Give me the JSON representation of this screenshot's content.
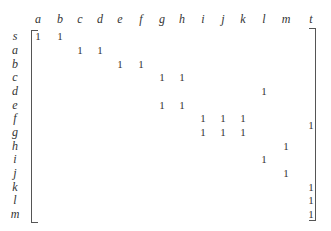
{
  "matrix": {
    "columns": [
      "a",
      "b",
      "c",
      "d",
      "e",
      "f",
      "g",
      "h",
      "i",
      "j",
      "k",
      "l",
      "m",
      "t"
    ],
    "rows": [
      "s",
      "a",
      "b",
      "c",
      "d",
      "e",
      "f",
      "g",
      "h",
      "i",
      "j",
      "k",
      "l",
      "m"
    ],
    "entries": [
      {
        "row": "s",
        "col": "a",
        "value": "1"
      },
      {
        "row": "s",
        "col": "b",
        "value": "1"
      },
      {
        "row": "a",
        "col": "c",
        "value": "1"
      },
      {
        "row": "a",
        "col": "d",
        "value": "1"
      },
      {
        "row": "b",
        "col": "e",
        "value": "1"
      },
      {
        "row": "b",
        "col": "f",
        "value": "1"
      },
      {
        "row": "c",
        "col": "g",
        "value": "1"
      },
      {
        "row": "c",
        "col": "h",
        "value": "1"
      },
      {
        "row": "d",
        "col": "l",
        "value": "1"
      },
      {
        "row": "e",
        "col": "g",
        "value": "1"
      },
      {
        "row": "e",
        "col": "h",
        "value": "1"
      },
      {
        "row": "f",
        "col": "i",
        "value": "1"
      },
      {
        "row": "f",
        "col": "j",
        "value": "1"
      },
      {
        "row": "f",
        "col": "k",
        "value": "1"
      },
      {
        "row": "g",
        "col": "i",
        "value": "1"
      },
      {
        "row": "g",
        "col": "j",
        "value": "1"
      },
      {
        "row": "g",
        "col": "k",
        "value": "1"
      },
      {
        "row": "g",
        "col": "t",
        "value": "1"
      },
      {
        "row": "h",
        "col": "m",
        "value": "1"
      },
      {
        "row": "i",
        "col": "l",
        "value": "1"
      },
      {
        "row": "j",
        "col": "m",
        "value": "1"
      },
      {
        "row": "k",
        "col": "t",
        "value": "1"
      },
      {
        "row": "l",
        "col": "t",
        "value": "1"
      },
      {
        "row": "m",
        "col": "t",
        "value": "1"
      }
    ]
  }
}
